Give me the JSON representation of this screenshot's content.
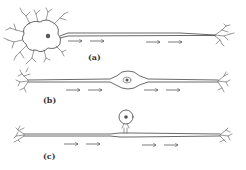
{
  "figure": {
    "panels": [
      {
        "id": "a",
        "label": "(a)",
        "type": "multipolar neuron"
      },
      {
        "id": "b",
        "label": "(b)",
        "type": "bipolar neuron"
      },
      {
        "id": "c",
        "label": "(c)",
        "type": "unipolar neuron"
      }
    ],
    "colors": {
      "line": "#444444",
      "background": "#ffffff"
    }
  }
}
